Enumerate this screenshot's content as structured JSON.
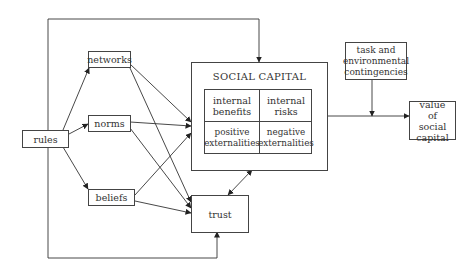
{
  "diagram": {
    "nodes": {
      "rules": "rules",
      "networks": "networks",
      "norms": "norms",
      "beliefs": "beliefs",
      "social_capital": {
        "title": "SOCIAL CAPITAL",
        "cells": {
          "internal_benefits": "internal benefits",
          "internal_risks": "internal risks",
          "positive_externalities": "positive externalities",
          "negative_externalities": "negative externalities"
        }
      },
      "trust": "trust",
      "task": "task and environmental contingencies",
      "value": "value of social capital"
    },
    "edges": [
      {
        "from": "rules",
        "to": "networks"
      },
      {
        "from": "rules",
        "to": "norms"
      },
      {
        "from": "rules",
        "to": "beliefs"
      },
      {
        "from": "rules",
        "to": "social_capital"
      },
      {
        "from": "rules",
        "to": "trust"
      },
      {
        "from": "networks",
        "to": "social_capital"
      },
      {
        "from": "networks",
        "to": "trust"
      },
      {
        "from": "norms",
        "to": "social_capital"
      },
      {
        "from": "norms",
        "to": "trust"
      },
      {
        "from": "beliefs",
        "to": "social_capital"
      },
      {
        "from": "beliefs",
        "to": "trust"
      },
      {
        "from": "social_capital",
        "to": "trust",
        "bidirectional": true
      },
      {
        "from": "social_capital",
        "to": "value"
      },
      {
        "from": "task",
        "to": "social_capital-value-link"
      }
    ]
  }
}
